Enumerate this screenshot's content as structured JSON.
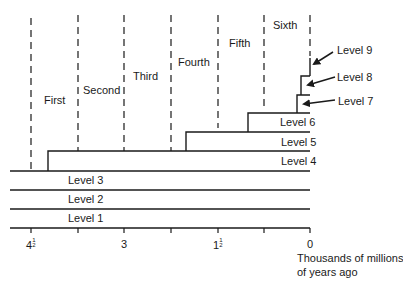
{
  "diagram": {
    "type": "timeline-stair-diagram",
    "line_color": "#1a1a1a",
    "periods": [
      {
        "label": "First"
      },
      {
        "label": "Second"
      },
      {
        "label": "Third"
      },
      {
        "label": "Fourth"
      },
      {
        "label": "Fifth"
      },
      {
        "label": "Sixth"
      }
    ],
    "levels": [
      {
        "label": "Level 1"
      },
      {
        "label": "Level 2"
      },
      {
        "label": "Level 3"
      },
      {
        "label": "Level 4"
      },
      {
        "label": "Level 5"
      },
      {
        "label": "Level 6"
      },
      {
        "label": "Level 7"
      },
      {
        "label": "Level 8"
      },
      {
        "label": "Level 9"
      }
    ],
    "axis": {
      "ticks": [
        "4½",
        "3",
        "1½",
        "0"
      ],
      "tick_labels": {
        "t45_whole": "4",
        "t45_frac_num": "1",
        "t45_frac_den": "2",
        "t3": "3",
        "t15_whole": "1",
        "t15_frac_num": "1",
        "t15_frac_den": "2",
        "t0": "0"
      },
      "unit_line1": "Thousands of millions",
      "unit_line2": "of years ago"
    }
  }
}
